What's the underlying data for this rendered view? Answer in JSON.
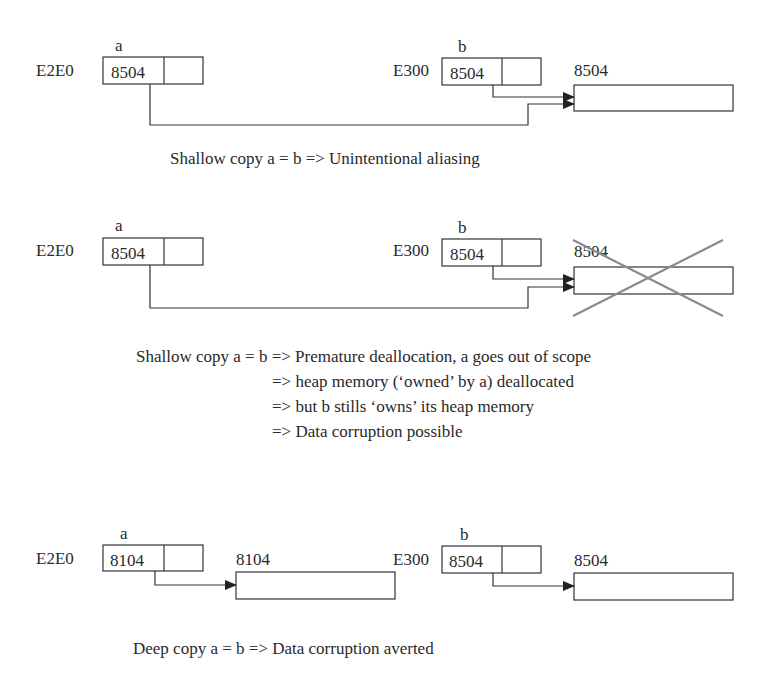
{
  "diagrams": [
    {
      "id": "shallow-aliasing",
      "var_a": {
        "name": "a",
        "address": "E2E0",
        "pointer_value": "8504"
      },
      "var_b": {
        "name": "b",
        "address": "E300",
        "pointer_value": "8504"
      },
      "heap": [
        {
          "label": "8504",
          "deallocated": false
        }
      ],
      "caption": [
        "Shallow copy a = b => Unintentional aliasing"
      ]
    },
    {
      "id": "shallow-premature-deallocation",
      "var_a": {
        "name": "a",
        "address": "E2E0",
        "pointer_value": "8504"
      },
      "var_b": {
        "name": "b",
        "address": "E300",
        "pointer_value": "8504"
      },
      "heap": [
        {
          "label": "8504",
          "deallocated": true
        }
      ],
      "caption": [
        "Shallow copy a = b => Premature deallocation, a goes out of scope",
        "=> heap memory (‘owned’ by a) deallocated",
        "=> but b stills ‘owns’ its heap memory",
        "=> Data corruption possible"
      ]
    },
    {
      "id": "deep-copy",
      "var_a": {
        "name": "a",
        "address": "E2E0",
        "pointer_value": "8104"
      },
      "var_b": {
        "name": "b",
        "address": "E300",
        "pointer_value": "8504"
      },
      "heap": [
        {
          "label": "8104",
          "deallocated": false
        },
        {
          "label": "8504",
          "deallocated": false
        }
      ],
      "caption": [
        "Deep copy a = b => Data corruption averted"
      ]
    }
  ],
  "colors": {
    "line": "#333333",
    "text": "#2a2a2a",
    "cross": "#8a8a8a",
    "background": "#ffffff"
  }
}
